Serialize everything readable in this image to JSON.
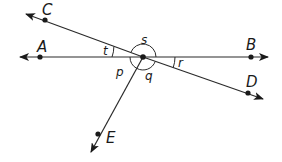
{
  "diagram": {
    "type": "intersecting lines and rays",
    "vertex": {
      "x": 143,
      "y": 57
    },
    "points": [
      {
        "name": "A",
        "label": "A",
        "x": 40,
        "y": 57,
        "lx": 38,
        "ly": 50
      },
      {
        "name": "B",
        "label": "B",
        "x": 251,
        "y": 57,
        "lx": 246,
        "ly": 48
      },
      {
        "name": "C",
        "label": "C",
        "x": 45,
        "y": 20,
        "lx": 42,
        "ly": 14
      },
      {
        "name": "D",
        "label": "D",
        "x": 248,
        "y": 93,
        "lx": 246,
        "ly": 87
      },
      {
        "name": "E",
        "label": "E",
        "x": 98,
        "y": 134,
        "lx": 106,
        "ly": 143
      }
    ],
    "angles": [
      {
        "name": "t",
        "label": "t",
        "between": "A-C"
      },
      {
        "name": "s",
        "label": "s",
        "between": "C-B"
      },
      {
        "name": "r",
        "label": "r",
        "between": "B-D"
      },
      {
        "name": "q",
        "label": "q",
        "between": "D-E"
      },
      {
        "name": "p",
        "label": "p",
        "between": "E-A"
      }
    ]
  },
  "labels": {
    "A": "A",
    "B": "B",
    "C": "C",
    "D": "D",
    "E": "E",
    "t": "t",
    "s": "s",
    "r": "r",
    "q": "q",
    "p": "p"
  }
}
